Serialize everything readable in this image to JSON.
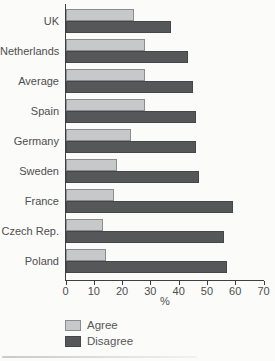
{
  "chart_data": {
    "type": "bar",
    "orientation": "horizontal",
    "title": "",
    "xlabel": "%",
    "ylabel": "",
    "categories": [
      "UK",
      "Netherlands",
      "Average",
      "Spain",
      "Germany",
      "Sweden",
      "France",
      "Czech Rep.",
      "Poland"
    ],
    "series": [
      {
        "name": "Agree",
        "fill": "#c7c8c9",
        "border": "#8b8c8d",
        "values": [
          24,
          28,
          28,
          28,
          23,
          18,
          17,
          13,
          14
        ]
      },
      {
        "name": "Disagree",
        "fill": "#565758",
        "border": "#454647",
        "values": [
          37,
          43,
          45,
          46,
          46,
          47,
          59,
          56,
          57
        ]
      }
    ],
    "x_ticks": [
      0,
      10,
      20,
      30,
      40,
      50,
      60,
      70
    ],
    "xlim": [
      0,
      70
    ],
    "grid": false,
    "legend_position": "bottom-left",
    "axis_color": "#3f3f3f",
    "text_color": "#4e4e4e"
  }
}
